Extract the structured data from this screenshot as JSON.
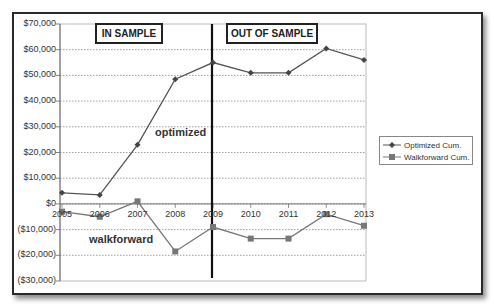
{
  "chart_data": {
    "type": "line",
    "title": "",
    "xlabel": "",
    "ylabel": "",
    "categories": [
      "2005",
      "2006",
      "2007",
      "2008",
      "2009",
      "2010",
      "2011",
      "2012",
      "2013"
    ],
    "series": [
      {
        "name": "Optimized Cum.",
        "marker": "diamond",
        "color": "#555555",
        "values": [
          4300,
          3500,
          23000,
          48500,
          55000,
          51000,
          51000,
          60500,
          56000
        ]
      },
      {
        "name": "Walkforward Cum.",
        "marker": "square",
        "color": "#777777",
        "values": [
          -3000,
          -5000,
          1000,
          -18500,
          -9000,
          -13500,
          -13500,
          -4000,
          -8500
        ]
      }
    ],
    "ylim": [
      -30000,
      70000
    ],
    "yticks": [
      70000,
      60000,
      50000,
      40000,
      30000,
      20000,
      10000,
      0,
      -10000,
      -20000,
      -30000
    ],
    "ytick_labels": [
      "$70,000",
      "$60,000",
      "$50,000",
      "$40,000",
      "$30,000",
      "$20,000",
      "$10,000",
      "$0",
      "($10,000)",
      "($20,000)",
      "($30,000)"
    ],
    "grid": "horizontal dotted",
    "legend_position": "right",
    "divider_at": "2009",
    "annotations": [
      {
        "text": "IN SAMPLE",
        "type": "boxed-label"
      },
      {
        "text": "OUT OF SAMPLE",
        "type": "boxed-label"
      },
      {
        "text": "optimized",
        "type": "series-label"
      },
      {
        "text": "walkforward",
        "type": "series-label"
      }
    ]
  },
  "labels": {
    "in_sample": "IN SAMPLE",
    "out_sample": "OUT OF SAMPLE",
    "optimized": "optimized",
    "walkforward": "walkforward"
  },
  "legend": {
    "items": [
      {
        "label": "Optimized Cum."
      },
      {
        "label": "Walkforward Cum."
      }
    ]
  }
}
